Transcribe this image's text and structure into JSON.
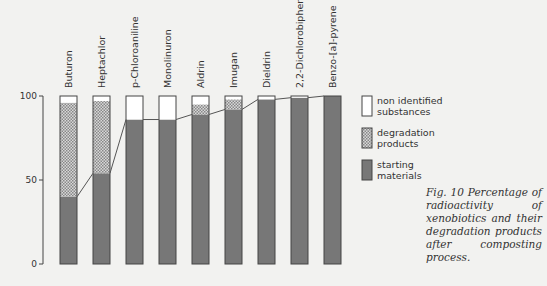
{
  "caption": "Fig. 10   Percentage of radioactivity of xenobiotics and their degradation products after composting process.",
  "chart_data": {
    "type": "bar",
    "stacked": true,
    "title": "",
    "xlabel": "",
    "ylabel": "",
    "ylim": [
      0,
      100
    ],
    "yticks": [
      0,
      50,
      100
    ],
    "grid": false,
    "legend_position": "right",
    "categories": [
      "Buturon",
      "Heptachlor",
      "p-Chloroaniline",
      "Monolinuron",
      "Aldrin",
      "Imugan",
      "Dieldrin",
      "2,2-Dichlorobiphenyl",
      "Benzo-[a]-pyrene"
    ],
    "series": [
      {
        "name": "starting materials",
        "key": "starting",
        "color": "#777777",
        "values": [
          40,
          54,
          86,
          86,
          89,
          92,
          98,
          99,
          100
        ]
      },
      {
        "name": "degradation products",
        "key": "degradation",
        "color": "#bbbbbb",
        "pattern": "crosshatch",
        "values": [
          56,
          43,
          0,
          0,
          6,
          6,
          0,
          0,
          0
        ]
      },
      {
        "name": "non identified substances",
        "key": "nonidentified",
        "color": "#ffffff",
        "values": [
          4,
          3,
          14,
          14,
          5,
          2,
          2,
          1,
          0
        ]
      }
    ],
    "line": {
      "name": "starting materials connector",
      "values": [
        40,
        54,
        86,
        86,
        89,
        92,
        98,
        99,
        100
      ]
    },
    "legend": [
      {
        "label_line1": "non identified",
        "label_line2": "substances",
        "key": "nonidentified"
      },
      {
        "label_line1": "degradation",
        "label_line2": "products",
        "key": "degradation"
      },
      {
        "label_line1": "starting",
        "label_line2": "materials",
        "key": "starting"
      }
    ]
  }
}
